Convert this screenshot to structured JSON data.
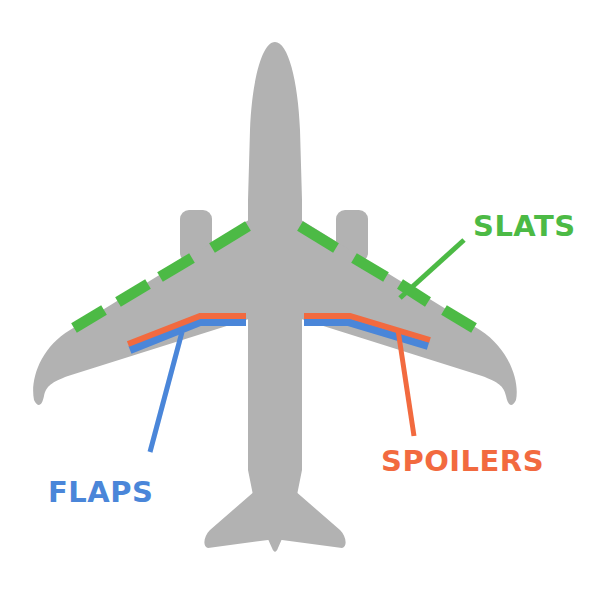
{
  "diagram": {
    "colors": {
      "airframe": "#b2b2b2",
      "slats": "#4cba45",
      "spoilers": "#f26a3f",
      "flaps": "#4a86d9",
      "background": "#ffffff"
    },
    "labels": {
      "slats": "SLATS",
      "spoilers": "SPOILERS",
      "flaps": "FLAPS"
    }
  }
}
